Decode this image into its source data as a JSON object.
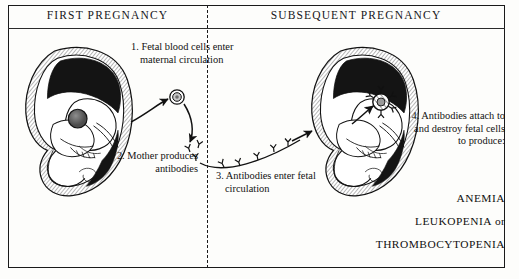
{
  "figure": {
    "panels": [
      {
        "id": "first",
        "title": "FIRST PREGNANCY"
      },
      {
        "id": "subsequent",
        "title": "SUBSEQUENT PREGNANCY"
      }
    ],
    "callouts": [
      {
        "number": "1.",
        "text": "1. Fetal blood cells enter maternal circulation"
      },
      {
        "number": "2.",
        "text": "2. Mother produces antibodies"
      },
      {
        "number": "3.",
        "text": "3. Antibodies enter fetal circulation"
      },
      {
        "number": "4.",
        "text": "4. Antibodies attach to and destroy fetal cells to produce:"
      }
    ],
    "outcomes": [
      {
        "name": "ANEMIA",
        "suffix": ""
      },
      {
        "name": "LEUKOPENIA",
        "suffix": " or"
      },
      {
        "name": "THROMBOCYTOPENIA",
        "suffix": ""
      }
    ],
    "colors": {
      "ink": "#1a1a1a",
      "paper": "#fdfdfb",
      "hatch": "#555555",
      "placenta": "#111111"
    },
    "icons": {
      "fetal_blood_cell": "blood-cell-icon",
      "antibody": "antibody-icon",
      "arrow": "arrow-icon",
      "divider": "dashed-divider"
    }
  }
}
